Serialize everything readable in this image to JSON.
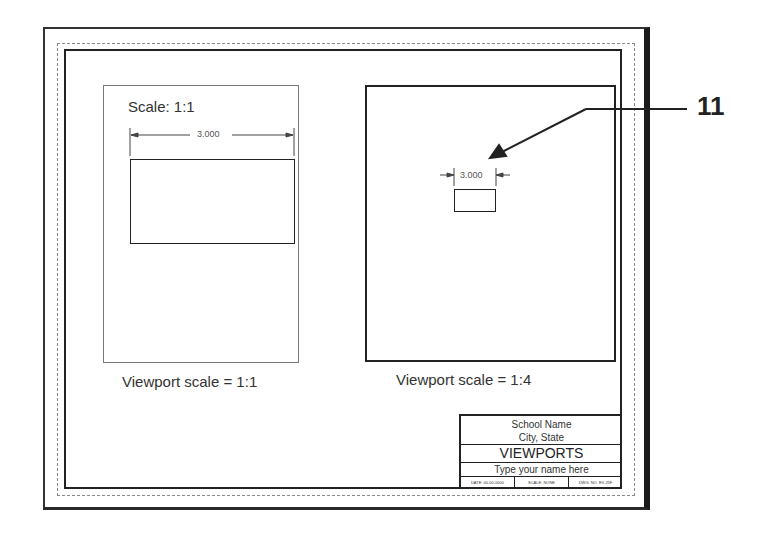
{
  "drawing": {
    "callout_number": "11",
    "left_viewport": {
      "scale_label": "Scale: 1:1",
      "dimension": "3.000",
      "caption": "Viewport scale = 1:1"
    },
    "right_viewport": {
      "dimension": "3.000",
      "caption": "Viewport scale = 1:4"
    },
    "title_block": {
      "school_name": "School Name",
      "city_state": "City, State",
      "title": "VIEWPORTS",
      "name_prompt": "Type your name here",
      "date": "DATE: 00-00-0000",
      "scale": "SCALE: NONE",
      "drawing_number": "DWG. NO. EV-25F"
    }
  },
  "colors": {
    "line": "#222222",
    "dashed": "#888888",
    "background": "#ffffff"
  }
}
